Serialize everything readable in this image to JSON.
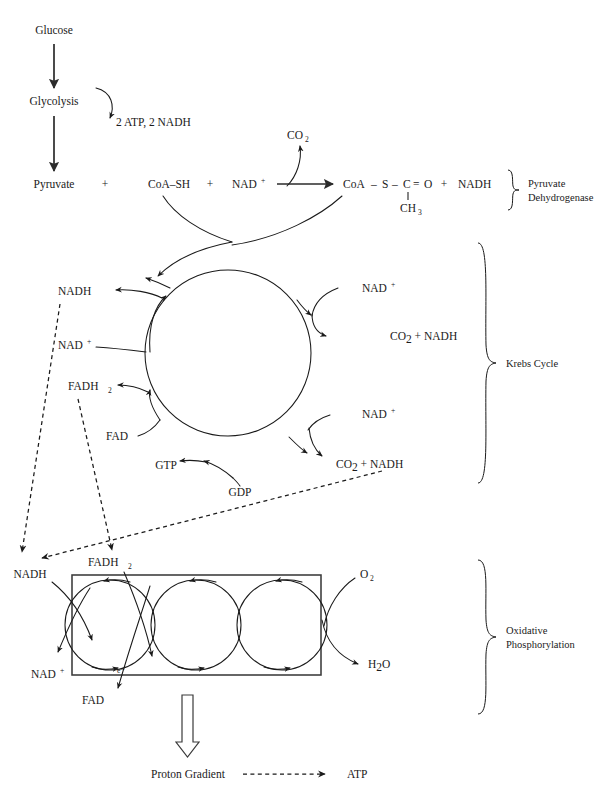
{
  "diagram": {
    "background_color": "#ffffff",
    "ink_color": "#1a1a1a"
  },
  "glycolysis": {
    "glucose": "Glucose",
    "glycolysis": "Glycolysis",
    "pyruvate": "Pyruvate",
    "yield": "2 ATP, 2 NADH"
  },
  "pdh": {
    "plus1": "+",
    "coash": "CoA–SH",
    "plus2": "+",
    "nad": "NAD",
    "nad_charge": "+",
    "co2": "CO",
    "co2_sub": "2",
    "product_coa": "CoA",
    "bond1": "–",
    "product_s": "S",
    "bond2": "–",
    "product_c": "C",
    "double_bond": "=",
    "product_o": "O",
    "product_ch3": "CH",
    "product_ch3_sub": "3",
    "plus3": "+",
    "nadh": "NADH",
    "brace_label_line1": "Pyruvate",
    "brace_label_line2": "Dehydrogenase"
  },
  "krebs": {
    "nadh_out": "NADH",
    "nad_in": "NAD",
    "nad_in_charge": "+",
    "fadh2": "FADH",
    "fadh2_sub": "2",
    "fad": "FAD",
    "gtp": "GTP",
    "gdp": "GDP",
    "nad_right_top": "NAD",
    "nad_right_top_charge": "+",
    "nad_right_bottom": "NAD",
    "nad_right_bottom_charge": "+",
    "co2_nadh_top_co2": "CO",
    "co2_nadh_top_sub": "2",
    "co2_nadh_top_rest": " + NADH",
    "co2_nadh_bottom_co2": "CO",
    "co2_nadh_bottom_sub": "2",
    "co2_nadh_bottom_rest": " + NADH",
    "brace_label": "Krebs Cycle"
  },
  "etc": {
    "nadh_in": "NADH",
    "nad_out": "NAD",
    "nad_out_charge": "+",
    "fadh2_in": "FADH",
    "fadh2_in_sub": "2",
    "fad_out": "FAD",
    "electron": "e",
    "electron_charge": "–",
    "o2": "O",
    "o2_sub": "2",
    "h2o_h": "H",
    "h2o_sub": "2",
    "h2o_o": "O",
    "brace_label_line1": "Oxidative",
    "brace_label_line2": "Phosphorylation"
  },
  "bottom": {
    "proton_gradient": "Proton Gradient",
    "atp": "ATP"
  }
}
